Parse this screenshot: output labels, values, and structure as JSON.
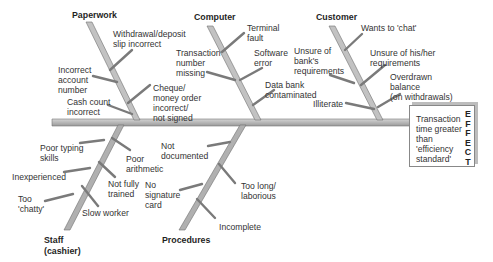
{
  "effect": {
    "text": "Transaction\ntime greater\nthan\n'efficiency\nstandard'",
    "label": "EFFECT"
  },
  "categories": {
    "paperwork": {
      "label": "Paperwork",
      "causes": [
        "Withdrawal/deposit\nslip incorrect",
        "Incorrect\naccount\nnumber",
        "Cheque/\nmoney order\nincorrect/\nnot signed",
        "Cash count\nincorrect"
      ]
    },
    "computer": {
      "label": "Computer",
      "causes": [
        "Terminal\nfault",
        "Transaction\nnumber\nmissing",
        "Software\nerror",
        "Data bank\ncontaminated"
      ]
    },
    "customer": {
      "label": "Customer",
      "causes": [
        "Wants to 'chat'",
        "Unsure of\nbank's\nrequirements",
        "Unsure of his/her\nrequirements",
        "Overdrawn\nbalance\n(on withdrawals)",
        "Illiterate"
      ]
    },
    "staff": {
      "label": "Staff\n(cashier)",
      "causes": [
        "Poor typing\nskills",
        "Poor\narithmetic",
        "Inexperienced",
        "Not fully\ntrained",
        "Too\n'chatty'",
        "Slow worker"
      ]
    },
    "procedures": {
      "label": "Procedures",
      "causes": [
        "Not\ndocumented",
        "No\nsignature\ncard",
        "Too long/\nlaborious",
        "Incomplete"
      ]
    }
  },
  "colors": {
    "bone_fill": "#bdbdbd",
    "bone_edge": "#6f6f6f",
    "text": "#333333"
  }
}
